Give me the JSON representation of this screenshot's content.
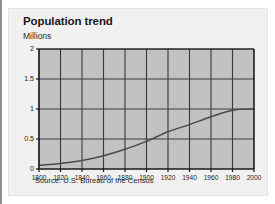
{
  "figure": {
    "title": "Population trend",
    "source_note": "Source: U.S. Bureau of the Census"
  },
  "colors": {
    "card_background": "#f1f1f1",
    "card_border": "#e2e2e2",
    "plot_fill": "#c2c2c2",
    "grid_line": "#3a3a3a",
    "axis_line": "#1a1a1a",
    "series_line": "#4a4a4a",
    "text": "#1a1a1a",
    "left_rule": "#8e8e8e"
  },
  "chart_data": {
    "type": "line",
    "title": "Population trend",
    "xlabel": "",
    "ylabel": "Millions",
    "ylim": [
      0,
      2
    ],
    "xlim": [
      1800,
      2000
    ],
    "grid": true,
    "legend": "none",
    "y_ticks": [
      0,
      0.5,
      1,
      1.5,
      2
    ],
    "y_tick_labels": [
      "0",
      "0.5",
      "1",
      "1.5",
      "2"
    ],
    "x_ticks": [
      1800,
      1820,
      1840,
      1860,
      1880,
      1900,
      1920,
      1940,
      1960,
      1980,
      2000
    ],
    "x_tick_labels": [
      "1800",
      "1820",
      "1840",
      "1860",
      "1880",
      "1900",
      "1920",
      "1940",
      "1960",
      "1980",
      "2000"
    ],
    "x": [
      1800,
      1820,
      1840,
      1860,
      1880,
      1900,
      1920,
      1940,
      1960,
      1980,
      2000
    ],
    "values": [
      0.06,
      0.09,
      0.14,
      0.22,
      0.33,
      0.46,
      0.62,
      0.74,
      0.87,
      0.98,
      1.0
    ],
    "series": [
      {
        "name": "Population",
        "values": [
          0.06,
          0.09,
          0.14,
          0.22,
          0.33,
          0.46,
          0.62,
          0.74,
          0.87,
          0.98,
          1.0
        ]
      }
    ]
  }
}
